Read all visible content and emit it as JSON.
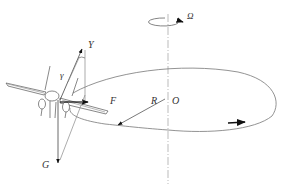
{
  "diagram": {
    "type": "aircraft-circular-turn-force-diagram",
    "labels": {
      "lift": "Y",
      "bank_angle": "γ",
      "centripetal_force": "F",
      "radius": "R",
      "center": "O",
      "gravity": "G",
      "angular_velocity": "Ω"
    },
    "colors": {
      "line": "#555555",
      "axis": "#aaaaaa",
      "arrow": "#111111",
      "text": "#333333",
      "background": "#ffffff"
    }
  }
}
